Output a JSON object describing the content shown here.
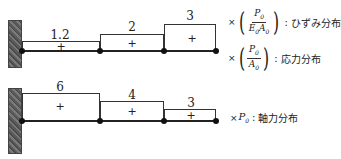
{
  "top_diagram": {
    "segments": [
      {
        "value": "1.2",
        "sign": "+"
      },
      {
        "value": "2",
        "sign": "+"
      },
      {
        "value": "3",
        "sign": "+"
      }
    ],
    "legends": [
      {
        "prefix": "×",
        "numerator": "P",
        "numerator_sub": "0",
        "denominator": "E",
        "denominator_sub": "0",
        "denominator2": "A",
        "denominator2_sub": "0",
        "label": "ひずみ分布"
      },
      {
        "prefix": "×",
        "numerator": "P",
        "numerator_sub": "0",
        "denominator": "A",
        "denominator_sub": "0",
        "label": "応力分布"
      }
    ]
  },
  "bottom_diagram": {
    "segments": [
      {
        "value": "6",
        "sign": "+"
      },
      {
        "value": "4",
        "sign": "+"
      },
      {
        "value": "3",
        "sign": "+"
      }
    ],
    "legend": {
      "prefix": "×",
      "variable": "P",
      "variable_sub": "0",
      "label": "軸力分布"
    }
  },
  "colon": ":"
}
